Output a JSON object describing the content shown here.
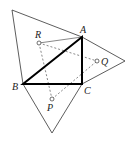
{
  "diagram": {
    "points": {
      "A": {
        "label": "A",
        "x": 82,
        "y": 37
      },
      "B": {
        "label": "B",
        "x": 23,
        "y": 84
      },
      "C": {
        "label": "C",
        "x": 82,
        "y": 84
      },
      "R": {
        "label": "R",
        "x": 39,
        "y": 43
      },
      "Q": {
        "label": "Q",
        "x": 97,
        "y": 61
      },
      "P": {
        "label": "P",
        "x": 52,
        "y": 99
      }
    },
    "outer_vertices": {
      "AB_apex": {
        "x": 12,
        "y": 10
      },
      "AC_apex": {
        "x": 125,
        "y": 61
      },
      "BC_apex": {
        "x": 52,
        "y": 133
      }
    },
    "labels": {
      "A": "A",
      "B": "B",
      "C": "C",
      "P": "P",
      "Q": "Q",
      "R": "R"
    }
  }
}
